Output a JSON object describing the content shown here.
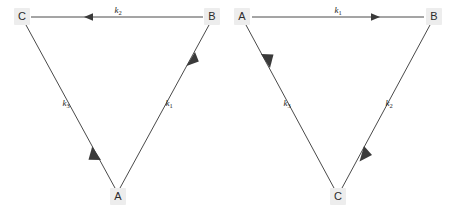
{
  "diagram": {
    "type": "reaction-cycle-pair",
    "background_color": "#ffffff",
    "line_color": "#4a4a4a",
    "label_color": "#1e1e1e",
    "vertex_box_color": "#ededed",
    "panels": [
      {
        "id": "left-panel",
        "name": "left-triangle",
        "vertices": [
          {
            "id": "C",
            "label": "C",
            "x": 22,
            "y": 16,
            "position": "top-left"
          },
          {
            "id": "B",
            "label": "B",
            "x": 212,
            "y": 16,
            "position": "top-right"
          },
          {
            "id": "A",
            "label": "A",
            "x": 118,
            "y": 196,
            "position": "bottom-center"
          }
        ],
        "edges": [
          {
            "id": "edge-B-C",
            "from": "B",
            "to": "C",
            "rate": "k",
            "subscript": "2",
            "label": "k2",
            "direction": "leftward",
            "label_x": 118,
            "label_y": 13
          },
          {
            "id": "edge-A-B",
            "from": "A",
            "to": "B",
            "rate": "k",
            "subscript": "1",
            "label": "k1",
            "direction": "up-right",
            "label_x": 166,
            "label_y": 106
          },
          {
            "id": "edge-C-A",
            "from": "C",
            "to": "A",
            "rate": "k",
            "subscript": "3",
            "label": "k3",
            "direction": "down-right",
            "label_x": 68,
            "label_y": 106
          }
        ]
      },
      {
        "id": "right-panel",
        "name": "right-triangle",
        "vertices": [
          {
            "id": "A",
            "label": "A",
            "x": 242,
            "y": 16,
            "position": "top-left"
          },
          {
            "id": "B",
            "label": "B",
            "x": 434,
            "y": 16,
            "position": "top-right"
          },
          {
            "id": "C",
            "label": "C",
            "x": 338,
            "y": 196,
            "position": "bottom-center"
          }
        ],
        "edges": [
          {
            "id": "edge-A-B-right",
            "from": "A",
            "to": "B",
            "rate": "k",
            "subscript": "1",
            "label": "k1",
            "direction": "rightward",
            "label_x": 338,
            "label_y": 13
          },
          {
            "id": "edge-B-C-right",
            "from": "B",
            "to": "C",
            "rate": "k",
            "subscript": "2",
            "label": "k2",
            "direction": "down-left",
            "label_x": 387,
            "label_y": 106
          },
          {
            "id": "edge-C-A-right",
            "from": "C",
            "to": "A",
            "rate": "k",
            "subscript": "3",
            "label": "k3",
            "direction": "up-left",
            "label_x": 289,
            "label_y": 106
          }
        ]
      }
    ]
  }
}
